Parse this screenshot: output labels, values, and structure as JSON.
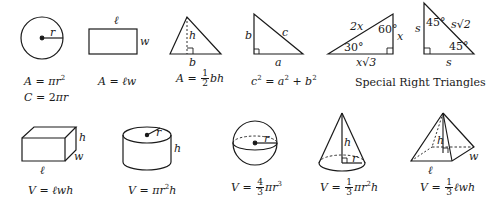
{
  "sheet": {
    "title": "Geometry Reference Formulas",
    "colors": {
      "ink": "#1a1a1a",
      "background": "#ffffff"
    }
  },
  "circle": {
    "label_r": "r",
    "area": {
      "lhs": "A",
      "eq": " = ",
      "pi": "π",
      "var": "r",
      "exp": "2"
    },
    "circumference": {
      "lhs": "C",
      "eq": " = 2",
      "pi": "π",
      "var": "r"
    }
  },
  "rectangle": {
    "label_l": "ℓ",
    "label_w": "w",
    "area": {
      "lhs": "A",
      "eq": " = ",
      "rhs": "ℓw"
    }
  },
  "triangle": {
    "label_h": "h",
    "label_b": "b",
    "area": {
      "lhs": "A",
      "eq": " = ",
      "num": "1",
      "den": "2",
      "rhs": "bh"
    }
  },
  "right_triangle": {
    "label_a": "a",
    "label_b": "b",
    "label_c": "c",
    "formula": {
      "c": "c",
      "a": "a",
      "b": "b",
      "exp": "2",
      "eq": " = ",
      "plus": " + "
    }
  },
  "special_30_60_90": {
    "hyp": "2x",
    "short": "x",
    "long": "x√3",
    "angle_small": "30°",
    "angle_large": "60°"
  },
  "special_45_45_90": {
    "leg_side": "s",
    "leg_bottom": "s",
    "hyp": "s√2",
    "angle_top": "45°",
    "angle_bottom": "45°"
  },
  "special_caption": "Special Right Triangles",
  "box": {
    "label_l": "ℓ",
    "label_w": "w",
    "label_h": "h",
    "volume": {
      "lhs": "V",
      "eq": " = ",
      "rhs": "ℓwh"
    }
  },
  "cylinder": {
    "label_r": "r",
    "label_h": "h",
    "volume": {
      "lhs": "V",
      "eq": " = ",
      "pi": "π",
      "var": "r",
      "exp": "2",
      "tail": "h"
    }
  },
  "sphere": {
    "label_r": "r",
    "volume": {
      "lhs": "V",
      "eq": " = ",
      "num": "4",
      "den": "3",
      "pi": "π",
      "var": "r",
      "exp": "3"
    }
  },
  "cone": {
    "label_r": "r",
    "label_h": "h",
    "volume": {
      "lhs": "V",
      "eq": " = ",
      "num": "1",
      "den": "3",
      "pi": "π",
      "var": "r",
      "exp": "2",
      "tail": "h"
    }
  },
  "pyramid": {
    "label_l": "ℓ",
    "label_w": "w",
    "label_h": "h",
    "volume": {
      "lhs": "V",
      "eq": " = ",
      "num": "1",
      "den": "3",
      "rhs": "ℓwh"
    }
  }
}
